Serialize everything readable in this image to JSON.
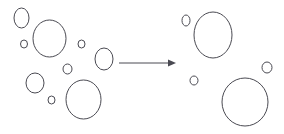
{
  "figure": {
    "type": "diagram",
    "title": "",
    "background_color": "#ffffff",
    "stroke_color": "#4a4a52",
    "width": 284,
    "height": 134,
    "panels": [
      {
        "name": "before-state",
        "label": "",
        "bubble_count": 9,
        "bubbles": [
          {
            "id": "left-b1",
            "cx": 21.5,
            "cy": 18.0,
            "rx": 7.5,
            "ry": 10.0,
            "size": "small"
          },
          {
            "id": "left-b2",
            "cx": 49.5,
            "cy": 38.5,
            "rx": 16.5,
            "ry": 18.5,
            "size": "large"
          },
          {
            "id": "left-b3",
            "cx": 24.0,
            "cy": 44.0,
            "rx": 3.5,
            "ry": 4.0,
            "size": "tiny"
          },
          {
            "id": "left-b4",
            "cx": 81.5,
            "cy": 44.0,
            "rx": 3.5,
            "ry": 4.0,
            "size": "tiny"
          },
          {
            "id": "left-b5",
            "cx": 104.0,
            "cy": 59.0,
            "rx": 9.0,
            "ry": 11.0,
            "size": "medium"
          },
          {
            "id": "left-b6",
            "cx": 67.5,
            "cy": 69.0,
            "rx": 4.5,
            "ry": 5.0,
            "size": "tiny"
          },
          {
            "id": "left-b7",
            "cx": 35.0,
            "cy": 83.0,
            "rx": 9.0,
            "ry": 10.0,
            "size": "medium"
          },
          {
            "id": "left-b8",
            "cx": 51.5,
            "cy": 100.0,
            "rx": 3.5,
            "ry": 4.0,
            "size": "tiny"
          },
          {
            "id": "left-b9",
            "cx": 83.5,
            "cy": 99.5,
            "rx": 17.5,
            "ry": 19.5,
            "size": "large"
          }
        ]
      },
      {
        "name": "after-state",
        "label": "",
        "bubble_count": 5,
        "bubbles": [
          {
            "id": "right-b1",
            "cx": 186.0,
            "cy": 20.5,
            "rx": 4.0,
            "ry": 5.5,
            "size": "tiny"
          },
          {
            "id": "right-b2",
            "cx": 213.0,
            "cy": 35.0,
            "rx": 19.0,
            "ry": 23.0,
            "size": "large"
          },
          {
            "id": "right-b3",
            "cx": 267.0,
            "cy": 67.5,
            "rx": 5.0,
            "ry": 5.5,
            "size": "tiny"
          },
          {
            "id": "right-b4",
            "cx": 194.0,
            "cy": 80.5,
            "rx": 4.0,
            "ry": 4.5,
            "size": "tiny"
          },
          {
            "id": "right-b5",
            "cx": 245.0,
            "cy": 102.0,
            "rx": 23.0,
            "ry": 24.0,
            "size": "large"
          }
        ]
      }
    ],
    "arrow": {
      "name": "transition-arrow",
      "label": "",
      "direction": "right",
      "x_start": 119,
      "x_end": 176,
      "y": 63
    }
  }
}
